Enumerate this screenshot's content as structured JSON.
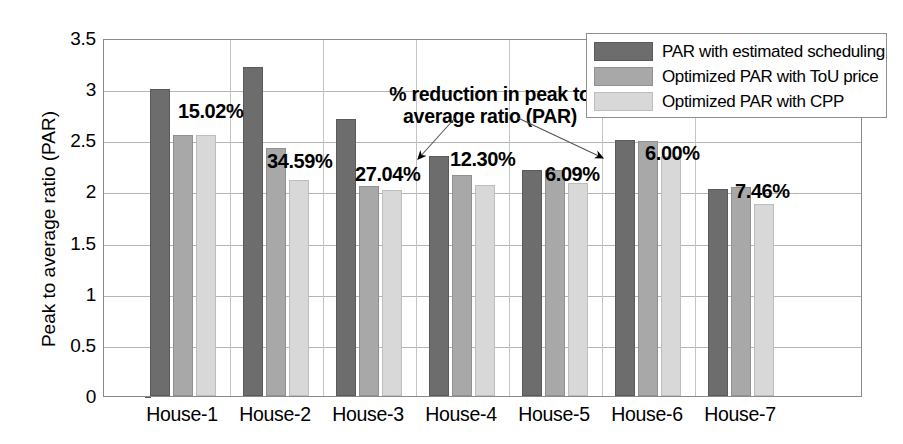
{
  "chart_data": {
    "type": "bar",
    "title": "",
    "xlabel": "",
    "ylabel": "Peak to average ratio (PAR)",
    "ylim": [
      0,
      3.5
    ],
    "yticks": [
      "0",
      "0.5",
      "1",
      "1.5",
      "2",
      "2.5",
      "3",
      "3.5"
    ],
    "ytick_values": [
      0,
      0.5,
      1,
      1.5,
      2,
      2.5,
      3,
      3.5
    ],
    "grid": true,
    "legend_position": "top-right",
    "categories": [
      "House-1",
      "House-2",
      "House-3",
      "House-4",
      "House-5",
      "House-6",
      "House-7"
    ],
    "series": [
      {
        "name": "PAR with estimated scheduling",
        "color": "#6d6d6d",
        "values": [
          3.0,
          3.22,
          2.71,
          2.35,
          2.21,
          2.5,
          2.02
        ]
      },
      {
        "name": "Optimized PAR with ToU price",
        "color": "#a8a8a8",
        "values": [
          2.55,
          2.42,
          2.05,
          2.16,
          2.21,
          2.49,
          2.04
        ]
      },
      {
        "name": "Optimized PAR with CPP",
        "color": "#d8d8d8",
        "values": [
          2.55,
          2.11,
          2.01,
          2.06,
          2.08,
          2.35,
          1.88
        ]
      }
    ],
    "data_labels": [
      {
        "text": "15.02%",
        "category": "House-1"
      },
      {
        "text": "34.59%",
        "category": "House-2"
      },
      {
        "text": "27.04%",
        "category": "House-3"
      },
      {
        "text": "12.30%",
        "category": "House-4"
      },
      {
        "text": "6.09%",
        "category": "House-5"
      },
      {
        "text": "6.00%",
        "category": "House-6"
      },
      {
        "text": "7.46%",
        "category": "House-7"
      }
    ],
    "annotations": [
      {
        "line1": "% reduction in peak to",
        "line2": "average ratio (PAR)",
        "arrows": [
          "27.04%",
          "6.09%"
        ]
      }
    ]
  },
  "legend": {
    "items": [
      {
        "label": "PAR with estimated scheduling"
      },
      {
        "label": "Optimized PAR with ToU price"
      },
      {
        "label": "Optimized PAR with CPP"
      }
    ]
  },
  "annotation": {
    "line1": "% reduction in peak to",
    "line2": "average ratio (PAR)"
  }
}
